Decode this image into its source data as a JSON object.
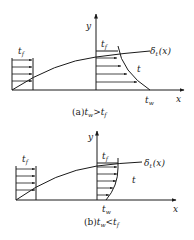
{
  "diagram": {
    "panels": [
      {
        "id": "a",
        "caption_prefix": "(a)",
        "caption_lhs": "t",
        "caption_lhs_sub": "w",
        "caption_op": ">",
        "caption_rhs": "t",
        "caption_rhs_sub": "f",
        "y_axis_label": "y",
        "x_axis_label": "x",
        "freestream_label": "t",
        "freestream_sub": "f",
        "profile_top_label": "t",
        "profile_top_sub": "f",
        "boundary_layer_label": "δ",
        "boundary_layer_sub": "t",
        "boundary_layer_arg": "(x)",
        "profile_label": "t",
        "wall_label": "t",
        "wall_sub": "w"
      },
      {
        "id": "b",
        "caption_prefix": "(b)",
        "caption_lhs": "t",
        "caption_lhs_sub": "w",
        "caption_op": "<",
        "caption_rhs": "t",
        "caption_rhs_sub": "f",
        "y_axis_label": "y",
        "x_axis_label": "x",
        "freestream_label": "t",
        "freestream_sub": "f",
        "profile_top_label": "t",
        "profile_top_sub": "f",
        "boundary_layer_label": "δ",
        "boundary_layer_sub": "t",
        "boundary_layer_arg": "(x)",
        "profile_label": "t",
        "wall_label": "t",
        "wall_sub": "w"
      }
    ],
    "colors": {
      "ink": "#1a1a1a",
      "background": "#ffffff"
    }
  }
}
